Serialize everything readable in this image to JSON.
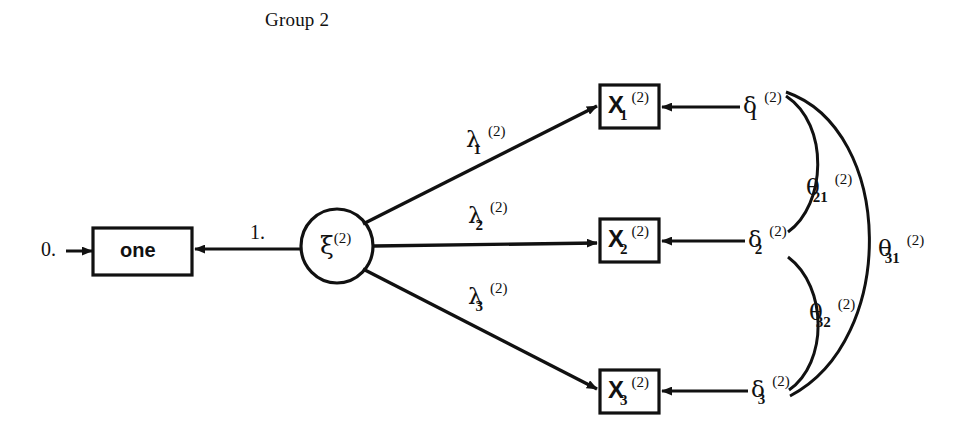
{
  "title": "Group 2",
  "constants": {
    "mean_zero": "0.",
    "loading_fixed": "1."
  },
  "nodes": {
    "constant_box": {
      "label": "one"
    },
    "latent": {
      "base": "ξ",
      "sup": "(2)",
      "sub": ""
    },
    "indicators": [
      {
        "base": "X",
        "sup": "(2)",
        "sub": "1"
      },
      {
        "base": "X",
        "sup": "(2)",
        "sub": "2"
      },
      {
        "base": "X",
        "sup": "(2)",
        "sub": "3"
      }
    ],
    "errors": [
      {
        "base": "δ",
        "sup": "(2)",
        "sub": "1"
      },
      {
        "base": "δ",
        "sup": "(2)",
        "sub": "2"
      },
      {
        "base": "δ",
        "sup": "(2)",
        "sub": "3"
      }
    ]
  },
  "loadings": [
    {
      "base": "λ",
      "sup": "(2)",
      "sub": "1"
    },
    {
      "base": "λ",
      "sup": "(2)",
      "sub": "2"
    },
    {
      "base": "λ",
      "sup": "(2)",
      "sub": "3"
    }
  ],
  "covariances": [
    {
      "base": "θ",
      "sup": "(2)",
      "sub": "21"
    },
    {
      "base": "θ",
      "sup": "(2)",
      "sub": "31"
    },
    {
      "base": "θ",
      "sup": "(2)",
      "sub": "32"
    }
  ],
  "colors": {
    "ink": "#111111",
    "background": "#ffffff"
  }
}
